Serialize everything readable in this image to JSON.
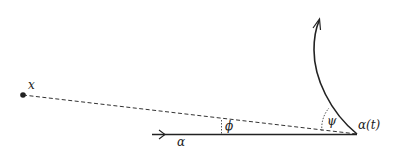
{
  "diagram": {
    "labels": {
      "point": "x",
      "curve": "α",
      "point_on_curve": "α(t)",
      "angle_phi": "ϕ",
      "angle_psi": "ψ"
    },
    "colors": {
      "ink": "#222222",
      "background": "#ffffff"
    }
  }
}
